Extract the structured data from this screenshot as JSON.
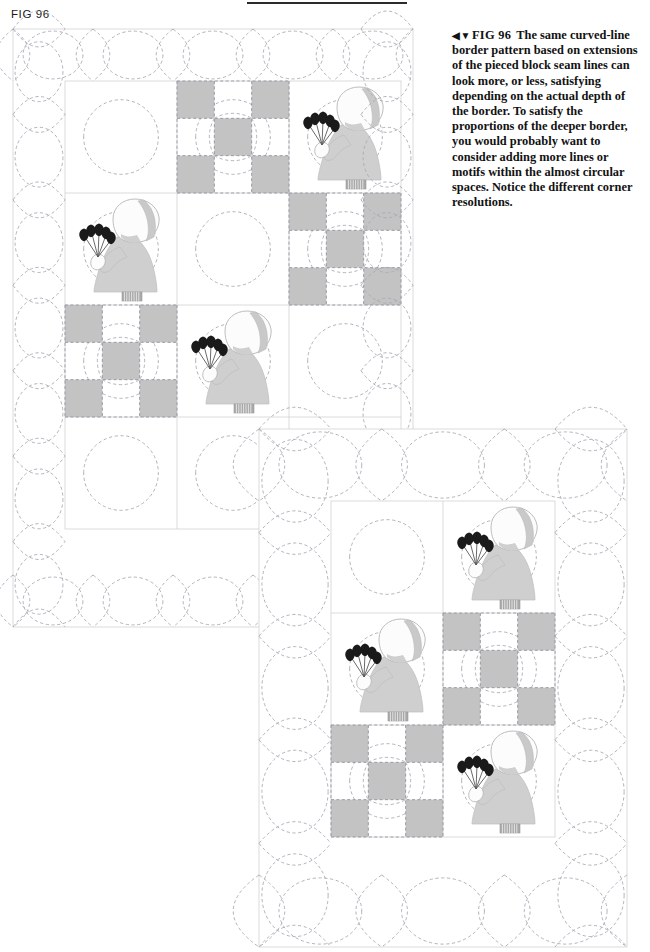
{
  "page": {
    "figure_label": "FIG 96",
    "top_rule": "horizontal-rule"
  },
  "caption": {
    "direction_marks": "◀▼",
    "figure_ref": "FIG 96",
    "text": "The same curved-line border pattern based on extensions of the pieced block seam lines can look more, or less, satisfying depending on the actual depth of the border. To satisfy the proportions of the deeper border, you would probably want to consider adding more lines or motifs within the almost circular spaces. Notice the different corner resolutions."
  },
  "colors": {
    "patch_gray": "#c3c3c3",
    "dress_gray": "#cfcfcf",
    "bonnet_white": "#fcfcfc",
    "bonnet_band": "#c9c9c9",
    "shoe_gray": "#a9a9a9",
    "flower_black": "#1a1a1a",
    "quilt_line": "#a9a9b4",
    "seam_line": "#8e8e9c",
    "block_outline": "#d2d2d2",
    "rule_dark": "#2b2b2b"
  },
  "quilts": [
    {
      "id": "quilt-1",
      "name": "shallow-border-quilt",
      "label": "Quilt with shallow border",
      "width": 400,
      "height": 598,
      "border_depth": 52,
      "block_size": 112,
      "cols": 3,
      "rows": 4,
      "patch_fraction": 0.3333,
      "blocks": [
        {
          "row": 0,
          "col": 0,
          "type": "empty"
        },
        {
          "row": 0,
          "col": 1,
          "type": "ninepatch"
        },
        {
          "row": 0,
          "col": 2,
          "type": "sunbonnet"
        },
        {
          "row": 1,
          "col": 0,
          "type": "sunbonnet"
        },
        {
          "row": 1,
          "col": 1,
          "type": "empty"
        },
        {
          "row": 1,
          "col": 2,
          "type": "ninepatch"
        },
        {
          "row": 2,
          "col": 0,
          "type": "ninepatch"
        },
        {
          "row": 2,
          "col": 1,
          "type": "sunbonnet"
        },
        {
          "row": 2,
          "col": 2,
          "type": "empty"
        },
        {
          "row": 3,
          "col": 0,
          "type": "empty"
        },
        {
          "row": 3,
          "col": 1,
          "type": "empty"
        },
        {
          "row": 3,
          "col": 2,
          "type": "empty"
        }
      ]
    },
    {
      "id": "quilt-2",
      "name": "deep-border-quilt",
      "label": "Quilt with deeper border",
      "width": 368,
      "height": 518,
      "border_depth": 72,
      "block_size": 112,
      "cols": 2,
      "rows": 3,
      "patch_fraction": 0.3333,
      "blocks": [
        {
          "row": 0,
          "col": 0,
          "type": "empty"
        },
        {
          "row": 0,
          "col": 1,
          "type": "sunbonnet"
        },
        {
          "row": 1,
          "col": 0,
          "type": "sunbonnet"
        },
        {
          "row": 1,
          "col": 1,
          "type": "ninepatch"
        },
        {
          "row": 2,
          "col": 0,
          "type": "ninepatch"
        },
        {
          "row": 2,
          "col": 1,
          "type": "sunbonnet"
        }
      ]
    }
  ]
}
